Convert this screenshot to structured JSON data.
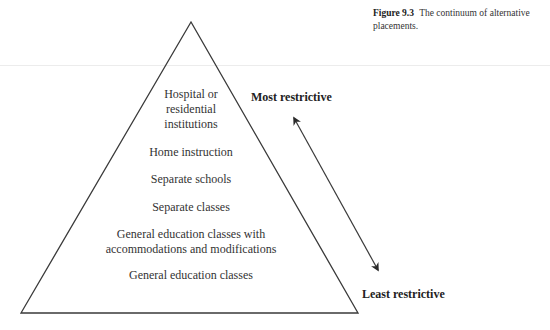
{
  "caption": {
    "figure_number": "Figure 9.3",
    "text": "The continuum of alternative placements."
  },
  "pyramid": {
    "tiers": [
      {
        "lines": [
          "Hospital or",
          "residential",
          "institutions"
        ]
      },
      {
        "lines": [
          "Home instruction"
        ]
      },
      {
        "lines": [
          "Separate schools"
        ]
      },
      {
        "lines": [
          "Separate classes"
        ]
      },
      {
        "lines": [
          "General education classes with",
          "accommodations and modifications"
        ]
      },
      {
        "lines": [
          "General education classes"
        ]
      }
    ]
  },
  "scale": {
    "top_label": "Most restrictive",
    "bottom_label": "Least restrictive"
  },
  "colors": {
    "line": "#3a3a3a",
    "text": "#333333",
    "rule": "#ececec"
  }
}
